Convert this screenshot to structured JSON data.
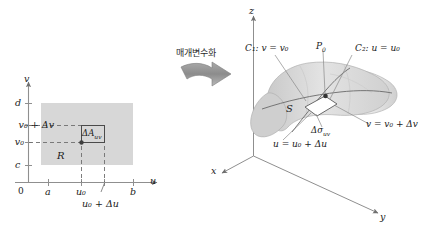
{
  "figure": {
    "caption_arrow_text": "매개변수화",
    "colors": {
      "region_fill": "#d6d6d6",
      "surface_fill": "#d2d2d2",
      "surface_fill_light": "#e6e6e6",
      "patch_fill": "#ffffff",
      "axis": "#8a8a8a",
      "line": "#4a4a4a",
      "dash": "#6e6e6e",
      "text": "#1a1a1a",
      "arrow": "#8f8f8f",
      "point": "#3c3c3c"
    }
  },
  "left_panel": {
    "name": "uv-plane domain",
    "axis_v_label": "v",
    "axis_u_label": "u",
    "origin_label": "0",
    "v_ticks": [
      {
        "label": "d"
      },
      {
        "label": "v₀ + Δv"
      },
      {
        "label": "v₀"
      },
      {
        "label": "c"
      }
    ],
    "u_ticks": [
      {
        "label": "a"
      },
      {
        "label": "u₀"
      },
      {
        "label": "u₀ + Δu"
      },
      {
        "label": "b"
      }
    ],
    "region_label": "R",
    "patch_label": "ΔA",
    "patch_label_sub": "uv"
  },
  "right_panel": {
    "name": "3D surface",
    "axis_z_label": "z",
    "axis_y_label": "y",
    "axis_x_label": "x",
    "surface_label": "S",
    "point_label": "P",
    "point_label_sub": "0",
    "curve_c1_label": "C₁: v = v₀",
    "curve_c2_label": "C₂: u = u₀",
    "edge_u_label": "u = u₀ + Δu",
    "edge_v_label": "v = v₀ + Δv",
    "patch_label": "Δσ",
    "patch_label_sub": "uv"
  }
}
